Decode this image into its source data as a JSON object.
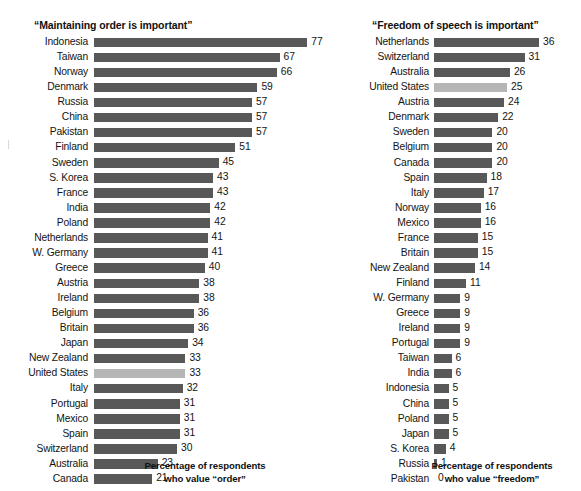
{
  "chart_data": [
    {
      "type": "bar",
      "orientation": "horizontal",
      "id": "order",
      "title": "“Maintaining order is important”",
      "xlabel": "Percentage of respondents who value “order”",
      "ylabel": "",
      "xlim": [
        0,
        77
      ],
      "grid": false,
      "legend": "none",
      "axis_caption_line1": "Percentage of respondents",
      "axis_caption_line2": "who value “order”",
      "highlight_category": "United States",
      "colors": {
        "bar": "#585858",
        "highlight": "#b6b6b6",
        "background": "#ffffff",
        "text": "#141414"
      },
      "categories": [
        "Indonesia",
        "Taiwan",
        "Norway",
        "Denmark",
        "Russia",
        "China",
        "Pakistan",
        "Finland",
        "Sweden",
        "S. Korea",
        "France",
        "India",
        "Poland",
        "Netherlands",
        "W. Germany",
        "Greece",
        "Austria",
        "Ireland",
        "Belgium",
        "Britain",
        "Japan",
        "New Zealand",
        "United States",
        "Italy",
        "Portugal",
        "Mexico",
        "Spain",
        "Switzerland",
        "Australia",
        "Canada"
      ],
      "values": [
        77,
        67,
        66,
        59,
        57,
        57,
        57,
        51,
        45,
        43,
        43,
        42,
        42,
        41,
        41,
        40,
        38,
        38,
        36,
        36,
        34,
        33,
        33,
        32,
        31,
        31,
        31,
        30,
        23,
        21
      ]
    },
    {
      "type": "bar",
      "orientation": "horizontal",
      "id": "freedom",
      "title": "“Freedom of speech is important”",
      "xlabel": "Percentage of respondents who value “freedom”",
      "ylabel": "",
      "xlim": [
        0,
        36
      ],
      "grid": false,
      "legend": "none",
      "axis_caption_line1": "Percentage of respondents",
      "axis_caption_line2": "who value “freedom”",
      "highlight_category": "United States",
      "colors": {
        "bar": "#585858",
        "highlight": "#b6b6b6",
        "background": "#ffffff",
        "text": "#141414"
      },
      "categories": [
        "Netherlands",
        "Switzerland",
        "Australia",
        "United States",
        "Austria",
        "Denmark",
        "Sweden",
        "Belgium",
        "Canada",
        "Spain",
        "Italy",
        "Norway",
        "Mexico",
        "France",
        "Britain",
        "New Zealand",
        "Finland",
        "W. Germany",
        "Greece",
        "Ireland",
        "Portugal",
        "Taiwan",
        "India",
        "Indonesia",
        "China",
        "Poland",
        "Japan",
        "S. Korea",
        "Russia",
        "Pakistan"
      ],
      "values": [
        36,
        31,
        26,
        25,
        24,
        22,
        20,
        20,
        20,
        18,
        17,
        16,
        16,
        15,
        15,
        14,
        11,
        9,
        9,
        9,
        9,
        6,
        6,
        5,
        5,
        5,
        5,
        4,
        1,
        0
      ]
    }
  ]
}
